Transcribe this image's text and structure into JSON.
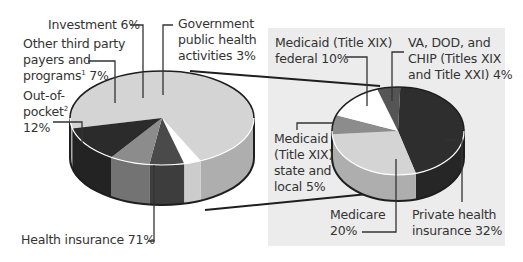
{
  "chart_data": {
    "type": "pie",
    "title": "",
    "charts": [
      {
        "name": "Overall health expenditure sources",
        "slices": [
          {
            "label": "Health insurance",
            "value": 71,
            "color": "#d4d4d4"
          },
          {
            "label": "Out-of-pocket",
            "footnote": "2",
            "value": 12,
            "color": "#2b2b2b"
          },
          {
            "label": "Other third party payers and programs",
            "footnote": "1",
            "value": 7,
            "color": "#8c8c8c"
          },
          {
            "label": "Investment",
            "value": 6,
            "color": "#4a4a4a"
          },
          {
            "label": "Government public health activities",
            "value": 3,
            "color": "#ffffff"
          }
        ]
      },
      {
        "name": "Health insurance breakdown",
        "exploded_from": "Health insurance",
        "slices": [
          {
            "label": "Private health insurance",
            "value": 32,
            "color": "#2e2e2e"
          },
          {
            "label": "Medicare",
            "value": 20,
            "color": "#d4d4d4"
          },
          {
            "label": "Medicaid (Title XIX) state and local",
            "value": 5,
            "color": "#8c8c8c"
          },
          {
            "label": "Medicaid (Title XIX) federal",
            "value": 10,
            "color": "#ffffff"
          },
          {
            "label": "VA, DOD, and CHIP (Titles XIX and Title XXI)",
            "value": 4,
            "color": "#555555"
          }
        ]
      }
    ]
  },
  "labels": {
    "investment": "Investment 6%",
    "gov_line1": "Government",
    "gov_line2": "public health",
    "gov_line3": "activities 3%",
    "other_line1": "Other third party",
    "other_line2": "payers and",
    "other_line3": "programs",
    "other_sup": "1",
    "other_pct": " 7%",
    "oop_line1": "Out-of-",
    "oop_line2": "pocket",
    "oop_sup": "2",
    "oop_line3": "12%",
    "health_ins": "Health insurance 71%",
    "mcaid_fed_line1": "Medicaid (Title XIX)",
    "mcaid_fed_line2": "federal 10%",
    "va_line1": "VA, DOD, and",
    "va_line2": "CHIP (Titles XIX",
    "va_line3": "and Title XXI) 4%",
    "mcaid_state_line1": "Medicaid",
    "mcaid_state_line2": "(Title XIX)",
    "mcaid_state_line3": "state and",
    "mcaid_state_line4": "local 5%",
    "medicare_line1": "Medicare",
    "medicare_line2": "20%",
    "private_line1": "Private health",
    "private_line2": "insurance 32%"
  },
  "colors": {
    "panel_bg": "#ececec",
    "outline": "#1e1e1e",
    "leader": "#333333"
  }
}
